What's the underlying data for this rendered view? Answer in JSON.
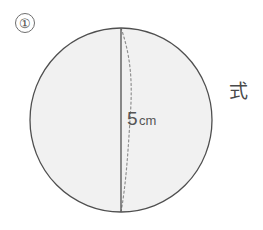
{
  "page": {
    "background_color": "#ffffff",
    "width": 263,
    "height": 230
  },
  "problem": {
    "number_label": "①",
    "answer_prompt_label": "式"
  },
  "figure": {
    "shape_name": "sphere",
    "fill_color": "#f1f1f1",
    "outline_color": "#4f4f4f",
    "diameter_line_color": "#4f4f4f",
    "dashed_curve_color": "#8d8d8d",
    "measurement": {
      "value": "5",
      "unit": "cm",
      "full": "5cm"
    }
  }
}
